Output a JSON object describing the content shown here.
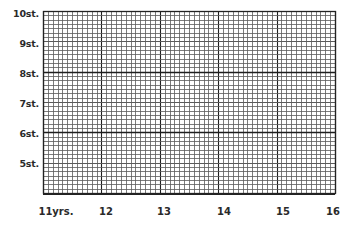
{
  "chart_data": {
    "type": "line",
    "title": "",
    "xlabel": "",
    "ylabel": "",
    "x_ticks": [
      "11yrs.",
      "12",
      "13",
      "14",
      "15",
      "16"
    ],
    "y_ticks": [
      "10st.",
      "9st.",
      "8st.",
      "7st.",
      "6st.",
      "5st."
    ],
    "xlim": [
      11,
      16
    ],
    "ylim": [
      4,
      10
    ],
    "x_unit": "years",
    "y_unit": "stones",
    "grid": true,
    "minor_x_per_major": 12,
    "minor_y_per_major": 7,
    "series": [],
    "legend": null
  },
  "axes": {
    "y_labels": [
      {
        "text": "10st.",
        "value": 10
      },
      {
        "text": "9st.",
        "value": 9
      },
      {
        "text": "8st.",
        "value": 8
      },
      {
        "text": "7st.",
        "value": 7
      },
      {
        "text": "6st.",
        "value": 6
      },
      {
        "text": "5st.",
        "value": 5
      }
    ],
    "x_labels": [
      {
        "text": "11yrs.",
        "value": 11
      },
      {
        "text": "12",
        "value": 12
      },
      {
        "text": "13",
        "value": 13
      },
      {
        "text": "14",
        "value": 14
      },
      {
        "text": "15",
        "value": 15
      },
      {
        "text": "16",
        "value": 16
      }
    ]
  },
  "colors": {
    "minor_grid": "#5a5a5a",
    "major_grid": "#1e1e1e",
    "border": "#222222"
  }
}
